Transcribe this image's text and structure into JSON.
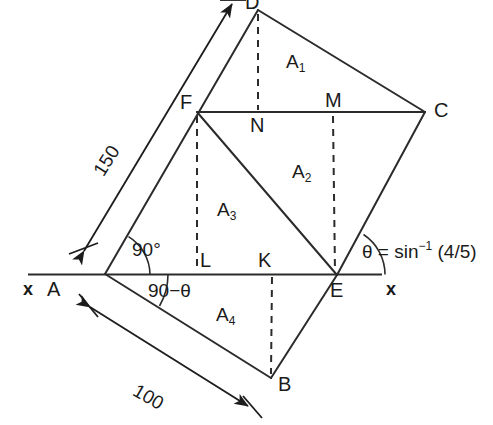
{
  "figure": {
    "vertices": [
      {
        "name": "A",
        "label": "A",
        "x": 105,
        "y": 274
      },
      {
        "name": "B",
        "label": "B",
        "x": 271,
        "y": 378
      },
      {
        "name": "C",
        "label": "C",
        "x": 425,
        "y": 112
      },
      {
        "name": "D",
        "label": "D",
        "x": 258,
        "y": 10
      },
      {
        "name": "E",
        "label": "E",
        "x": 337,
        "y": 275
      },
      {
        "name": "F",
        "label": "F",
        "x": 197,
        "y": 112
      },
      {
        "name": "K",
        "label": "K",
        "x": 272,
        "y": 274
      },
      {
        "name": "L",
        "label": "L",
        "x": 197,
        "y": 274
      },
      {
        "name": "M",
        "label": "M",
        "x": 333,
        "y": 112
      },
      {
        "name": "N",
        "label": "N",
        "x": 258,
        "y": 112
      }
    ],
    "vertex_labels": {
      "A": "A",
      "B": "B",
      "C": "C",
      "D": "D",
      "E": "E",
      "F": "F",
      "K": "K",
      "L": "L",
      "M": "M",
      "N": "N"
    },
    "area_labels": {
      "a1": "A",
      "a1_sub": "1",
      "a2": "A",
      "a2_sub": "2",
      "a3": "A",
      "a3_sub": "3",
      "a4": "A",
      "a4_sub": "4"
    },
    "dimensions": {
      "side_ad": "150",
      "side_ab": "100"
    },
    "angles": {
      "right_angle": "90°",
      "complement": "90−θ",
      "theta_prefix": "θ = sin",
      "theta_exponent": "−1",
      "theta_value": "(4/5)"
    },
    "axis_labels": {
      "left": "x",
      "right": "x"
    },
    "colors": {
      "stroke": "#2b2b2b",
      "text": "#1a1a1a",
      "background": "#ffffff"
    }
  }
}
